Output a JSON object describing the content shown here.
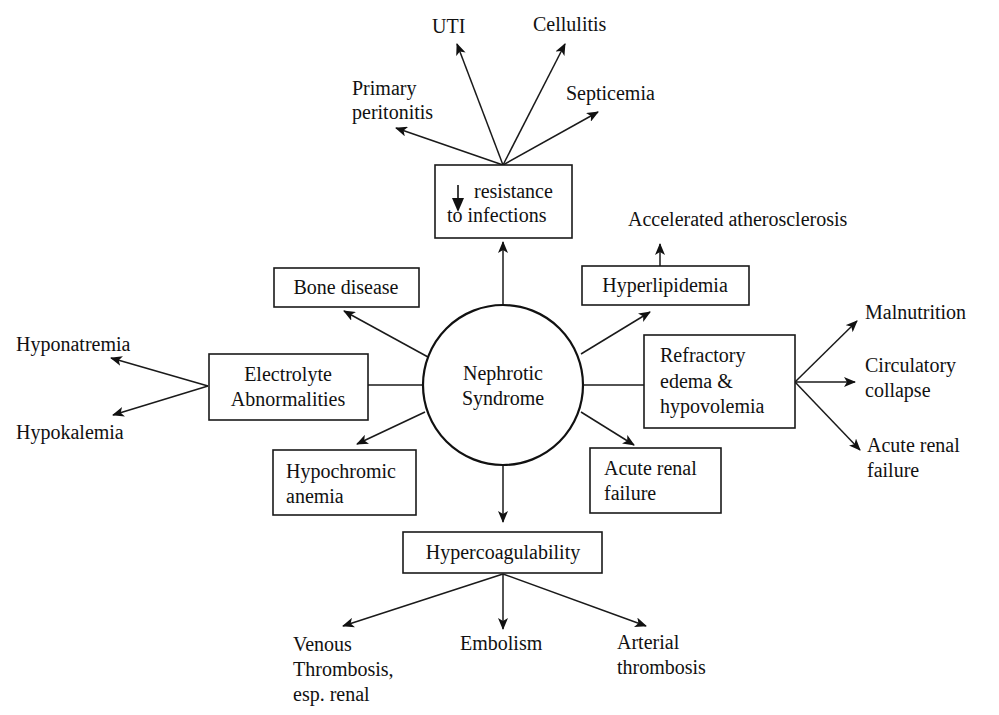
{
  "diagram": {
    "type": "concept-map",
    "center": {
      "line1": "Nephrotic",
      "line2": "Syndrome"
    },
    "boxes": {
      "resistance": {
        "line1": "resistance",
        "line2": "to infections",
        "prefix_icon": "down-arrow"
      },
      "bone": {
        "label": "Bone disease"
      },
      "hyperlipidemia": {
        "label": "Hyperlipidemia"
      },
      "electrolyte": {
        "line1": "Electrolyte",
        "line2": "Abnormalities"
      },
      "edema": {
        "line1": "Refractory",
        "line2": "edema &",
        "line3": "hypovolemia"
      },
      "anemia": {
        "line1": "Hypochromic",
        "line2": "anemia"
      },
      "arf_box": {
        "line1": "Acute renal",
        "line2": "failure"
      },
      "hypercoag": {
        "label": "Hypercoagulability"
      }
    },
    "leaves": {
      "uti": "UTI",
      "cellulitis": "Cellulitis",
      "peritonitis": {
        "line1": "Primary",
        "line2": "peritonitis"
      },
      "septicemia": "Septicemia",
      "atherosclerosis": "Accelerated atherosclerosis",
      "hyponatremia": "Hyponatremia",
      "hypokalemia": "Hypokalemia",
      "malnutrition": "Malnutrition",
      "circulatory": {
        "line1": "Circulatory",
        "line2": "collapse"
      },
      "arf_leaf": {
        "line1": "Acute renal",
        "line2": "failure"
      },
      "venous": {
        "line1": "Venous",
        "line2": "Thrombosis,",
        "line3": "esp. renal"
      },
      "embolism": "Embolism",
      "arterial": {
        "line1": "Arterial",
        "line2": "thrombosis"
      }
    },
    "colors": {
      "ink": "#1a1a1a",
      "background": "#ffffff"
    }
  }
}
